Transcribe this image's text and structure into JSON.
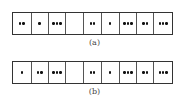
{
  "figure": {
    "strips": [
      {
        "label": "(a)",
        "cells": [
          2,
          1,
          3,
          0,
          2,
          1,
          3,
          2,
          3
        ],
        "widths": [
          19,
          17,
          18,
          18,
          18,
          18,
          18,
          17,
          18
        ]
      },
      {
        "label": "(b)",
        "cells": [
          1,
          2,
          3,
          0,
          2,
          1,
          3,
          2,
          3
        ],
        "widths": [
          19,
          17,
          18,
          18,
          18,
          18,
          18,
          17,
          18
        ]
      }
    ]
  }
}
